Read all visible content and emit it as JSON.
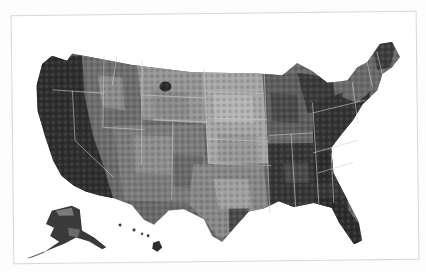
{
  "map": {
    "type": "choropleth",
    "subject": "US counties",
    "palette": {
      "darkest": "#2a2a2a",
      "dark": "#3c3c3c",
      "mid_dark": "#5a5a5a",
      "mid": "#7a7a7a",
      "light": "#9a9a9a",
      "lightest": "#b8b8b8",
      "border": "#cfcfcf",
      "background": "#ffffff"
    },
    "regions": [
      "Contiguous US",
      "Alaska",
      "Hawaii"
    ]
  }
}
